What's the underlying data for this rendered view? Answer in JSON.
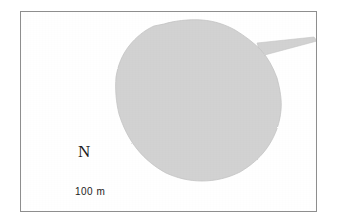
{
  "figure": {
    "kind": "site-plan-map",
    "background_color": "#ffffff",
    "frame_color": "#8e8e8e",
    "ink_color": "#1c1c1c"
  },
  "map": {
    "enclosure": {
      "label": "shaded-enclosure-area",
      "fill_color": "#d2d2d2",
      "edge_color": "#c4c4c4",
      "outline_points": [
        [
          143,
          12
        ],
        [
          160,
          9
        ],
        [
          178,
          8
        ],
        [
          196,
          10
        ],
        [
          210,
          15
        ],
        [
          222,
          22
        ],
        [
          232,
          29
        ],
        [
          240,
          36
        ],
        [
          246,
          44
        ],
        [
          252,
          55
        ],
        [
          256,
          67
        ],
        [
          259,
          80
        ],
        [
          260,
          93
        ],
        [
          258,
          106
        ],
        [
          253,
          119
        ],
        [
          246,
          131
        ],
        [
          237,
          142
        ],
        [
          226,
          152
        ],
        [
          213,
          160
        ],
        [
          199,
          166
        ],
        [
          184,
          169
        ],
        [
          169,
          169
        ],
        [
          155,
          166
        ],
        [
          142,
          160
        ],
        [
          131,
          152
        ],
        [
          122,
          142
        ],
        [
          114,
          131
        ],
        [
          107,
          119
        ],
        [
          101,
          106
        ],
        [
          97,
          92
        ],
        [
          95,
          78
        ],
        [
          95,
          64
        ],
        [
          98,
          51
        ],
        [
          104,
          40
        ],
        [
          112,
          30
        ],
        [
          122,
          21
        ],
        [
          132,
          15
        ]
      ],
      "spur": {
        "label": "northeast-narrow-spur",
        "points": [
          [
            238,
            33
          ],
          [
            292,
            26
          ],
          [
            296,
            29
          ],
          [
            240,
            42
          ]
        ]
      }
    },
    "entrance_marker": {
      "label": "west-entrance-arrow",
      "arrowhead_tip": [
        42,
        77
      ],
      "bar_start": [
        53,
        76
      ],
      "bar_end": [
        75,
        78
      ],
      "color": "#1a1a1a"
    },
    "north_arrow": {
      "label": "N",
      "line_top": [
        65,
        95
      ],
      "line_bottom": [
        65,
        175
      ],
      "color": "#1a1a1a"
    },
    "scale_bar": {
      "label": "100 m",
      "bar_left": [
        50,
        190
      ],
      "bar_right": [
        126,
        190
      ],
      "tick_height": 6,
      "color": "#1a1a1a"
    }
  }
}
